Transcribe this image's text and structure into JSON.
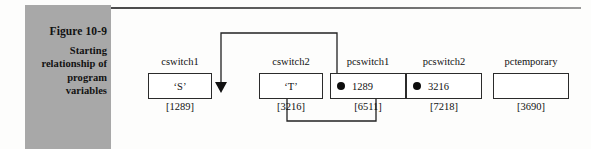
{
  "figure": {
    "number": "Figure 10-9",
    "caption_lines": [
      "Starting",
      "relationship of",
      "program",
      "variables"
    ]
  },
  "diagram": {
    "type": "pointer-variable-diagram",
    "nodes": [
      {
        "id": "cswitch1",
        "label": "cswitch1",
        "value": "‘S’",
        "address": "[1289]",
        "has_pointer_dot": false
      },
      {
        "id": "cswitch2",
        "label": "cswitch2",
        "value": "‘T’",
        "address": "[3216]",
        "has_pointer_dot": false
      },
      {
        "id": "pcswitch1",
        "label": "pcswitch1",
        "value": "1289",
        "address": "[6511]",
        "has_pointer_dot": true
      },
      {
        "id": "pcswitch2",
        "label": "pcswitch2",
        "value": "3216",
        "address": "[7218]",
        "has_pointer_dot": true
      },
      {
        "id": "pctemporary",
        "label": "pctemporary",
        "value": "",
        "address": "[3690]",
        "has_pointer_dot": false
      }
    ],
    "links": [
      {
        "from": "pcswitch1",
        "to": "cswitch1",
        "route": "up-over-down"
      },
      {
        "from": "pcswitch2",
        "to": "cswitch2",
        "route": "down-under-up"
      }
    ]
  },
  "colors": {
    "caption_panel": "#a8a8a8",
    "ink": "#111111",
    "page": "#fdfdfc"
  }
}
